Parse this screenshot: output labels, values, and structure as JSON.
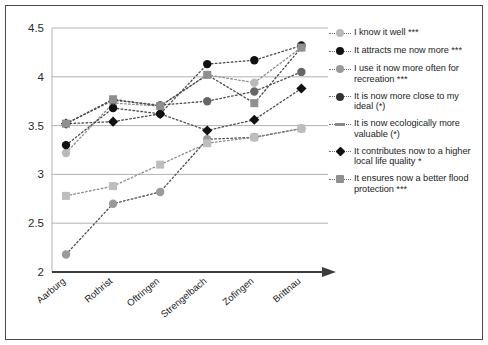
{
  "chart_data": {
    "type": "line",
    "title": "",
    "xlabel": "",
    "ylabel": "",
    "ylim": [
      2,
      4.5
    ],
    "yticks": [
      "2",
      "2.5",
      "3",
      "3.5",
      "4",
      "4.5"
    ],
    "grid": true,
    "legend_position": "right",
    "categories": [
      "Aarburg",
      "Rothrist",
      "Oftringen",
      "Strengelbach",
      "Zofingen",
      "Brittnau"
    ],
    "series": [
      {
        "name": "I know it well ***",
        "marker": "circle",
        "color": "#b9b9b9",
        "values": [
          3.22,
          3.73,
          3.7,
          4.02,
          3.94,
          4.3
        ]
      },
      {
        "name": "It attracts me now more ***",
        "marker": "circle",
        "color": "#111111",
        "values": [
          3.3,
          3.68,
          3.62,
          4.13,
          4.17,
          4.32
        ]
      },
      {
        "name": "I use it now more often for recreation ***",
        "marker": "circle",
        "color": "#9a9a9a",
        "values": [
          2.18,
          2.7,
          2.82,
          3.36,
          3.38,
          3.47
        ]
      },
      {
        "name": "It is now more close to my ideal (*)",
        "marker": "circle",
        "color": "#666666",
        "values": [
          3.52,
          3.76,
          3.71,
          3.75,
          3.85,
          4.05
        ]
      },
      {
        "name": "It is now ecologically more valuable (*)",
        "marker": "square",
        "color": "#bdbdbd",
        "values": [
          2.78,
          2.88,
          3.1,
          3.32,
          3.38,
          3.47
        ]
      },
      {
        "name": "It contributes now to a higher local life quality *",
        "marker": "diamond",
        "color": "#111111",
        "values": [
          3.52,
          3.54,
          3.62,
          3.45,
          3.56,
          3.88
        ]
      },
      {
        "name": "It ensures now a better flood protection ***",
        "marker": "square",
        "color": "#8f8f8f",
        "values": [
          3.52,
          3.77,
          3.7,
          4.02,
          3.73,
          4.3
        ]
      }
    ]
  },
  "legend": {
    "items": [
      {
        "label": "I know it well ***",
        "marker": "circle",
        "color": "#b9b9b9"
      },
      {
        "label": "It attracts me now more ***",
        "marker": "circle",
        "color": "#111111"
      },
      {
        "label": "I use it now more often for recreation ***",
        "marker": "circle",
        "color": "#9a9a9a"
      },
      {
        "label": "It is now more close to my ideal (*)",
        "marker": "circle",
        "color": "#333333"
      },
      {
        "label": "It is now ecologically more valuable (*)",
        "marker": "dash",
        "color": "#8a8a8a"
      },
      {
        "label": "It contributes now to a higher local life quality *",
        "marker": "diamond",
        "color": "#111111"
      },
      {
        "label": "It ensures now a better flood protection ***",
        "marker": "square",
        "color": "#8f8f8f"
      }
    ]
  }
}
